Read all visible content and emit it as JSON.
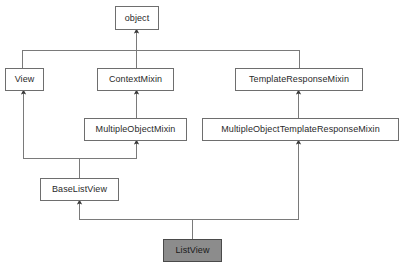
{
  "diagram": {
    "type": "uml-class-inheritance",
    "colors": {
      "background": "#ffffff",
      "node_fill": "#ffffff",
      "node_border": "#6e6e6e",
      "highlight_fill": "#8c8c8c",
      "highlight_border": "#4a4a4a",
      "edge": "#7a7a7a",
      "text": "#2a2a2a"
    },
    "nodes": [
      {
        "id": "object",
        "label": "object",
        "x": 115,
        "y": 6,
        "w": 44,
        "h": 24,
        "highlight": false
      },
      {
        "id": "view",
        "label": "View",
        "x": 5,
        "y": 68,
        "w": 39,
        "h": 23,
        "highlight": false
      },
      {
        "id": "context_mixin",
        "label": "ContextMixin",
        "x": 97,
        "y": 68,
        "w": 77,
        "h": 23,
        "highlight": false
      },
      {
        "id": "template_response_mixin",
        "label": "TemplateResponseMixin",
        "x": 235,
        "y": 68,
        "w": 128,
        "h": 23,
        "highlight": false
      },
      {
        "id": "multiple_object_mixin",
        "label": "MultipleObjectMixin",
        "x": 84,
        "y": 118,
        "w": 103,
        "h": 23,
        "highlight": false
      },
      {
        "id": "multiple_object_template_response_mixin",
        "label": "MultipleObjectTemplateResponseMixin",
        "x": 202,
        "y": 118,
        "w": 197,
        "h": 23,
        "highlight": false
      },
      {
        "id": "base_list_view",
        "label": "BaseListView",
        "x": 40,
        "y": 178,
        "w": 79,
        "h": 23,
        "highlight": false
      },
      {
        "id": "list_view",
        "label": "ListView",
        "x": 163,
        "y": 239,
        "w": 59,
        "h": 23,
        "highlight": true
      }
    ],
    "edges": [
      {
        "id": "view-to-object",
        "from": "View",
        "to": "object",
        "kind": "inheritance"
      },
      {
        "id": "context-mixin-to-object",
        "from": "ContextMixin",
        "to": "object",
        "kind": "inheritance"
      },
      {
        "id": "template-response-mixin-to-object",
        "from": "TemplateResponseMixin",
        "to": "object",
        "kind": "inheritance"
      },
      {
        "id": "multiple-object-mixin-to-context-mixin",
        "from": "MultipleObjectMixin",
        "to": "ContextMixin",
        "kind": "inheritance"
      },
      {
        "id": "multiple-object-template-response-mixin-to-template-response-mixin",
        "from": "MultipleObjectTemplateResponseMixin",
        "to": "TemplateResponseMixin",
        "kind": "inheritance"
      },
      {
        "id": "base-list-view-to-view",
        "from": "BaseListView",
        "to": "View",
        "kind": "inheritance"
      },
      {
        "id": "base-list-view-to-multiple-object-mixin",
        "from": "BaseListView",
        "to": "MultipleObjectMixin",
        "kind": "inheritance"
      },
      {
        "id": "list-view-to-base-list-view",
        "from": "ListView",
        "to": "BaseListView",
        "kind": "inheritance"
      },
      {
        "id": "list-view-to-multiple-object-template-response-mixin",
        "from": "ListView",
        "to": "MultipleObjectTemplateResponseMixin",
        "kind": "inheritance"
      }
    ]
  }
}
